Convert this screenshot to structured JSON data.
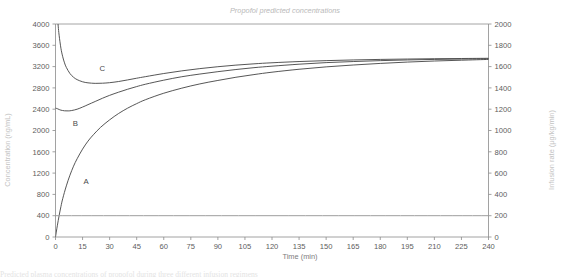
{
  "chart_data": {
    "type": "line",
    "title": "Propofol predicted concentrations",
    "xlabel": "Time (min)",
    "ylabel": "Concentration (ng/mL)",
    "y2label": "Infusion rate (µg/kg/min)",
    "xlim": [
      0,
      240
    ],
    "ylim": [
      0,
      4000
    ],
    "y2lim": [
      0,
      2000
    ],
    "grid": false,
    "legend_position": "inline-labels",
    "xticks": [
      0,
      15,
      30,
      45,
      60,
      75,
      90,
      105,
      120,
      135,
      150,
      165,
      180,
      195,
      210,
      225,
      240
    ],
    "yticks": [
      0,
      400,
      800,
      1200,
      1600,
      2000,
      2400,
      2800,
      3200,
      3600,
      4000
    ],
    "y2ticks": [
      0,
      200,
      400,
      600,
      800,
      1000,
      1200,
      1400,
      1600,
      1800,
      2000
    ],
    "annotations": [
      {
        "text": "A",
        "x": 17,
        "y": 1000
      },
      {
        "text": "B",
        "x": 11,
        "y": 2090
      },
      {
        "text": "C",
        "x": 26,
        "y": 3115
      }
    ],
    "series": [
      {
        "name": "A",
        "axis": "left",
        "label": "A",
        "x": [
          0,
          1,
          2,
          3,
          4,
          6,
          8,
          10,
          12,
          15,
          18,
          21,
          25,
          30,
          35,
          40,
          45,
          50,
          60,
          70,
          80,
          90,
          100,
          110,
          120,
          135,
          150,
          165,
          180,
          195,
          210,
          225,
          240
        ],
        "y": [
          0,
          210,
          400,
          570,
          720,
          960,
          1160,
          1330,
          1470,
          1650,
          1800,
          1920,
          2060,
          2200,
          2320,
          2420,
          2505,
          2580,
          2700,
          2795,
          2875,
          2940,
          3000,
          3050,
          3095,
          3150,
          3195,
          3230,
          3260,
          3285,
          3305,
          3320,
          3335
        ]
      },
      {
        "name": "B",
        "axis": "left",
        "label": "B",
        "x": [
          0,
          1,
          2,
          3,
          5,
          7,
          9,
          12,
          15,
          18,
          22,
          26,
          30,
          35,
          40,
          45,
          50,
          60,
          70,
          80,
          90,
          100,
          110,
          120,
          135,
          150,
          165,
          180,
          195,
          210,
          225,
          240
        ],
        "y": [
          2420,
          2410,
          2395,
          2382,
          2370,
          2368,
          2375,
          2400,
          2440,
          2485,
          2545,
          2605,
          2660,
          2720,
          2775,
          2825,
          2870,
          2945,
          3010,
          3060,
          3105,
          3145,
          3180,
          3208,
          3245,
          3275,
          3295,
          3312,
          3325,
          3335,
          3342,
          3348
        ]
      },
      {
        "name": "C",
        "axis": "left",
        "label": "C",
        "x": [
          0,
          0.5,
          1,
          1.5,
          2,
          3,
          4,
          5,
          6,
          8,
          10,
          12,
          15,
          18,
          22,
          26,
          30,
          35,
          40,
          45,
          50,
          60,
          70,
          80,
          90,
          100,
          110,
          120,
          135,
          150,
          165,
          180,
          195,
          210,
          225,
          240
        ],
        "y": [
          4850,
          4480,
          4180,
          3960,
          3790,
          3545,
          3385,
          3270,
          3185,
          3070,
          3000,
          2955,
          2915,
          2895,
          2885,
          2888,
          2898,
          2920,
          2950,
          2982,
          3012,
          3070,
          3120,
          3162,
          3198,
          3228,
          3252,
          3272,
          3295,
          3312,
          3325,
          3335,
          3342,
          3348,
          3352,
          3356
        ]
      },
      {
        "name": "Infusion rate",
        "axis": "right",
        "label": "",
        "x": [
          0,
          240
        ],
        "y": [
          200,
          200
        ]
      }
    ]
  },
  "caption": {
    "text": "Predicted plasma concentrations of propofol during three different infusion regimens"
  },
  "colors": {
    "curve": "#4d4d4d",
    "infusion": "#9d9d9d",
    "axis": "#8a8a8a",
    "title": "#b9b9b9",
    "tick": "#5d5d5d"
  }
}
